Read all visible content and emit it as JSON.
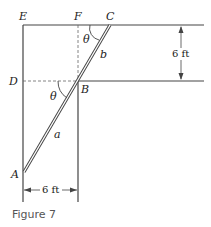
{
  "figure": {
    "caption": "Figure 7",
    "points": {
      "E": "E",
      "F": "F",
      "C": "C",
      "D": "D",
      "B": "B",
      "A": "A"
    },
    "segments": {
      "a": "a",
      "b": "b"
    },
    "angles": {
      "theta_top": "θ",
      "theta_bottom": "θ"
    },
    "dimensions": {
      "vertical": "6 ft",
      "horizontal": "6 ft"
    },
    "colors": {
      "line": "#444444",
      "text": "#222222",
      "caption": "#555555"
    }
  }
}
